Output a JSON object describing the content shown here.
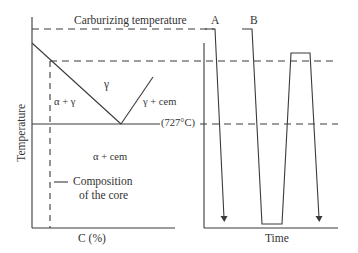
{
  "left_diagram": {
    "title": "Carburizing temperature",
    "y_axis_label": "Temperature",
    "x_axis_label": "C (%)",
    "eutectoid_label": "(727°C)",
    "regions": {
      "gamma": "γ",
      "alpha_gamma": "α + γ",
      "gamma_cem": "γ + cem",
      "alpha_cem": "α + cem"
    },
    "annotation": {
      "line1": "Composition",
      "line2": "of the core"
    }
  },
  "right_diagram": {
    "x_axis_label": "Time",
    "paths": [
      {
        "id": "A",
        "label": "A"
      },
      {
        "id": "B",
        "label": "B"
      }
    ]
  },
  "colors": {
    "line": "#3a3a3a",
    "text": "#333333",
    "background": "#ffffff"
  }
}
